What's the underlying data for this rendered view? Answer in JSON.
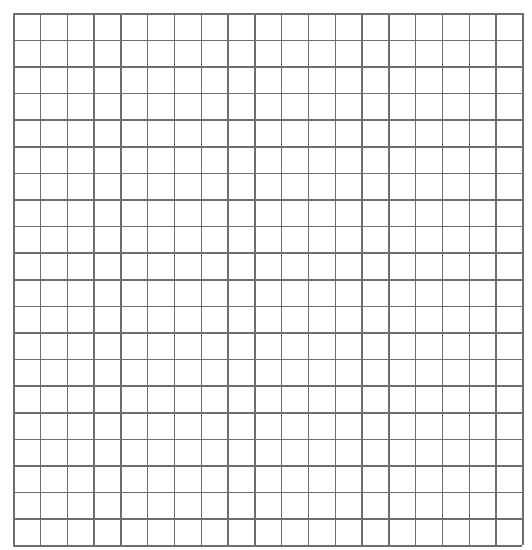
{
  "page": {
    "width": 532,
    "height": 550,
    "background_color": "#ffffff"
  },
  "grid": {
    "name": "graph-paper-grid",
    "origin_x": 13,
    "origin_y": 13,
    "width": 509,
    "height": 532,
    "columns": 19,
    "rows": 20,
    "cell_width": 26.8,
    "cell_height": 26.6,
    "line_color": "#6e6e6e",
    "line_width": 1.5,
    "fill_color": "#ffffff",
    "cell_label": "",
    "cells_total": 380
  },
  "chart_data": {
    "type": "table",
    "columns": 19,
    "rows": 20,
    "values": [],
    "xlabel": "",
    "ylabel": "",
    "grid": true,
    "legend": "none"
  }
}
